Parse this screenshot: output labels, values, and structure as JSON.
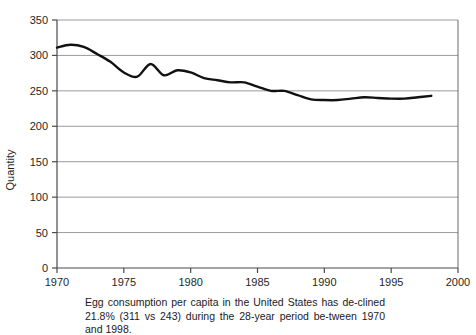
{
  "figure": {
    "caption": "Egg consumption per capita in the United States has de-clined 21.8% (311 vs 243) during the 28-year period be-tween 1970 and 1998."
  },
  "chart_data": {
    "type": "line",
    "title": "",
    "xlabel": "",
    "ylabel": "Quantity",
    "xlim": [
      1970,
      2000
    ],
    "ylim": [
      0,
      350
    ],
    "ytick_labels": [
      "0",
      "50",
      "100",
      "150",
      "200",
      "250",
      "300",
      "350"
    ],
    "yticks": [
      0,
      50,
      100,
      150,
      200,
      250,
      300,
      350
    ],
    "xtick_labels": [
      "1970",
      "1975",
      "1980",
      "1985",
      "1990",
      "1995",
      "2000"
    ],
    "xticks": [
      1970,
      1975,
      1980,
      1985,
      1990,
      1995,
      2000
    ],
    "grid": "horizontal",
    "legend": "none",
    "line_color": "#111111",
    "grid_color": "#9a9a9a",
    "series": [
      {
        "name": "Egg consumption per capita",
        "x": [
          1970,
          1971,
          1972,
          1973,
          1974,
          1975,
          1976,
          1977,
          1978,
          1979,
          1980,
          1981,
          1982,
          1983,
          1984,
          1985,
          1986,
          1987,
          1988,
          1989,
          1990,
          1991,
          1992,
          1993,
          1994,
          1995,
          1996,
          1997,
          1998
        ],
        "values": [
          311,
          315,
          312,
          302,
          291,
          276,
          270,
          288,
          272,
          279,
          276,
          268,
          265,
          262,
          262,
          256,
          250,
          250,
          244,
          238,
          237,
          237,
          239,
          241,
          240,
          239,
          239,
          241,
          243
        ]
      }
    ]
  }
}
